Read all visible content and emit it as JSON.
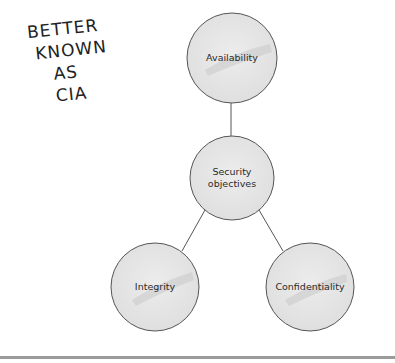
{
  "annotation": {
    "lines": [
      "BETTER",
      "KNOWN",
      "AS",
      "CIA"
    ],
    "color": "#222222"
  },
  "diagram": {
    "center_node": {
      "id": "security-objectives",
      "label_line1": "Security",
      "label_line2": "objectives",
      "cx": 232,
      "cy": 178,
      "r": 42
    },
    "nodes": [
      {
        "id": "availability",
        "label": "Availability",
        "cx": 232,
        "cy": 58,
        "r": 45
      },
      {
        "id": "integrity",
        "label": "Integrity",
        "cx": 155,
        "cy": 287,
        "r": 44
      },
      {
        "id": "confidentiality",
        "label": "Confidentiality",
        "cx": 310,
        "cy": 287,
        "r": 44
      }
    ],
    "edges": [
      {
        "from": "security-objectives",
        "to": "availability"
      },
      {
        "from": "security-objectives",
        "to": "integrity"
      },
      {
        "from": "security-objectives",
        "to": "confidentiality"
      }
    ],
    "colors": {
      "node_fill": "#e4e4e4",
      "node_stroke": "#555555",
      "edge": "#555555",
      "highlight": "#cfcfcf"
    }
  }
}
